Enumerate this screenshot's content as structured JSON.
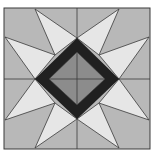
{
  "diagram": {
    "colors": {
      "background": "#ffffff",
      "outer_square": "#b8b8b8",
      "star_points": "#e6e6e6",
      "dark_frame": "#202020",
      "inner_diamond": "#8c8c8c",
      "lines": "#3a3a3a"
    },
    "outer_square": {
      "x1": 4,
      "y1": 8,
      "x2": 150,
      "y2": 149
    },
    "center": {
      "x": 77,
      "y": 79
    },
    "star_point_count": 8
  }
}
